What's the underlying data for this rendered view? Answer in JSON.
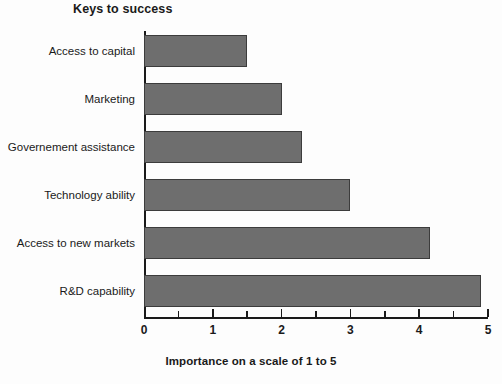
{
  "chart_data": {
    "type": "bar",
    "orientation": "horizontal",
    "title": "Keys to success",
    "xlabel": "Importance on a scale of 1 to 5",
    "ylabel": "",
    "categories": [
      "Access to capital",
      "Marketing",
      "Governement assistance",
      "Technology ability",
      "Access to new markets",
      "R&D capability"
    ],
    "values": [
      1.5,
      2.0,
      2.3,
      3.0,
      4.15,
      4.9
    ],
    "xlim": [
      0,
      5
    ],
    "xticks": [
      0,
      1,
      2,
      3,
      4,
      5
    ],
    "xtick_labels": [
      "0",
      "1",
      "2",
      "3",
      "4",
      "5"
    ],
    "minor_tick_interval": 0.5,
    "grid": false,
    "legend": null,
    "bar_color": "#6e6e6e",
    "bar_edge_color": "#3c3c3c",
    "axis_color": "#1a1a1a",
    "background_color": "#fdfdfd"
  }
}
